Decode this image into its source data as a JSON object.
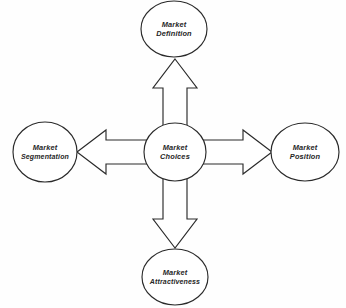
{
  "diagram": {
    "title": "Market Choices",
    "type": "hub-and-spoke",
    "colors": {
      "stroke": "#2a2a2a",
      "fill": "#ffffff",
      "text": "#262626",
      "background": "#fefefe"
    },
    "center": {
      "id": "market-choices",
      "label_line1": "Market",
      "label_line2": "Choices"
    },
    "nodes": [
      {
        "id": "market-definition",
        "position": "top",
        "label_line1": "Market",
        "label_line2": "Definition"
      },
      {
        "id": "market-position",
        "position": "right",
        "label_line1": "Market",
        "label_line2": "Position"
      },
      {
        "id": "market-attractiveness",
        "position": "bottom",
        "label_line1": "Market",
        "label_line2": "Attractiveness"
      },
      {
        "id": "market-segmentation",
        "position": "left",
        "label_line1": "Market",
        "label_line2": "Segmentation"
      }
    ],
    "arrows": [
      {
        "id": "arrow-up",
        "direction": "up",
        "from": "market-choices",
        "to": "market-definition"
      },
      {
        "id": "arrow-right",
        "direction": "right",
        "from": "market-choices",
        "to": "market-position"
      },
      {
        "id": "arrow-down",
        "direction": "down",
        "from": "market-choices",
        "to": "market-attractiveness"
      },
      {
        "id": "arrow-left",
        "direction": "left",
        "from": "market-choices",
        "to": "market-segmentation"
      }
    ]
  }
}
